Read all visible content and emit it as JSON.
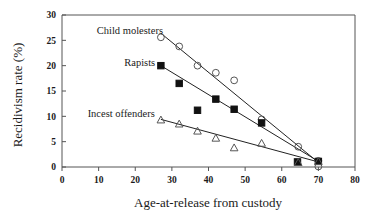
{
  "chart_data": {
    "type": "scatter",
    "title": "",
    "xlabel": "Age-at-release from custody",
    "ylabel": "Recidivism rate (%)",
    "xlim": [
      0,
      80
    ],
    "ylim": [
      0,
      30
    ],
    "xticks": [
      0,
      10,
      20,
      30,
      40,
      50,
      60,
      70,
      80
    ],
    "yticks": [
      0,
      5,
      10,
      15,
      20,
      25,
      30
    ],
    "grid": false,
    "legend_position": "inline-annotations",
    "series": [
      {
        "name": "Child molesters",
        "marker": "open-circle",
        "points": [
          {
            "x": 27.0,
            "y": 25.6
          },
          {
            "x": 32.0,
            "y": 23.8
          },
          {
            "x": 37.0,
            "y": 20.0
          },
          {
            "x": 42.0,
            "y": 18.6
          },
          {
            "x": 47.0,
            "y": 17.1
          },
          {
            "x": 54.5,
            "y": 9.4
          },
          {
            "x": 64.5,
            "y": 4.0
          },
          {
            "x": 70.0,
            "y": 0.1
          },
          {
            "x": 70.0,
            "y": 1.2
          }
        ],
        "fit_line": {
          "x1": 27.0,
          "y1": 26.4,
          "x2": 70.5,
          "y2": 0.6
        }
      },
      {
        "name": "Rapists",
        "marker": "filled-square",
        "points": [
          {
            "x": 27.0,
            "y": 20.0
          },
          {
            "x": 32.0,
            "y": 16.5
          },
          {
            "x": 37.0,
            "y": 11.2
          },
          {
            "x": 42.0,
            "y": 13.4
          },
          {
            "x": 47.0,
            "y": 11.4
          },
          {
            "x": 54.5,
            "y": 8.7
          },
          {
            "x": 64.3,
            "y": 1.0
          },
          {
            "x": 70.0,
            "y": 1.1
          }
        ],
        "fit_line": {
          "x1": 27.0,
          "y1": 20.0,
          "x2": 70.5,
          "y2": 0.9
        }
      },
      {
        "name": "Incest offenders",
        "marker": "open-triangle",
        "points": [
          {
            "x": 27.0,
            "y": 9.3
          },
          {
            "x": 32.0,
            "y": 8.5
          },
          {
            "x": 37.0,
            "y": 7.1
          },
          {
            "x": 42.0,
            "y": 5.7
          },
          {
            "x": 47.0,
            "y": 3.8
          },
          {
            "x": 54.5,
            "y": 4.7
          },
          {
            "x": 64.5,
            "y": 0.9
          },
          {
            "x": 70.0,
            "y": 1.1
          }
        ],
        "fit_line": {
          "x1": 27.0,
          "y1": 9.4,
          "x2": 70.5,
          "y2": 0.9
        }
      }
    ],
    "annotations": [
      {
        "text": "Child molesters",
        "x": 9.5,
        "y": 27.0
      },
      {
        "text": "Rapists",
        "x": 17.0,
        "y": 20.6
      },
      {
        "text": "Incest offenders",
        "x": 7.0,
        "y": 10.6
      }
    ]
  },
  "axes": {
    "x": {
      "title": "Age-at-release from custody",
      "tick_labels": [
        "0",
        "10",
        "20",
        "30",
        "40",
        "50",
        "60",
        "70",
        "80"
      ]
    },
    "y": {
      "title": "Recidivism rate (%)",
      "tick_labels": [
        "0",
        "5",
        "10",
        "15",
        "20",
        "25",
        "30"
      ]
    }
  },
  "colors": {
    "axis": "#555555",
    "line": "#222222",
    "filled_marker": "#111111",
    "text": "#1a1a1a",
    "background": "#ffffff"
  }
}
